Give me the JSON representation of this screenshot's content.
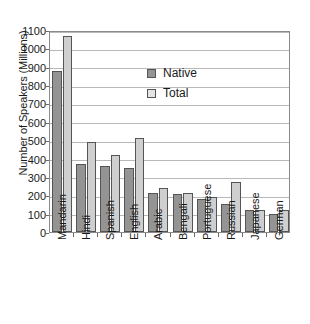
{
  "chart_data": {
    "type": "bar",
    "title": "",
    "xlabel": "",
    "ylabel": "Number of Speakers (Millions)",
    "ylim": [
      0,
      1100
    ],
    "ytick_step": 100,
    "yticks": [
      0,
      100,
      200,
      300,
      400,
      500,
      600,
      700,
      800,
      900,
      1000,
      1100
    ],
    "ytick_labels": [
      "0",
      "100",
      "200",
      "300",
      "400",
      "500",
      "600",
      "700",
      "800",
      "900",
      "1000",
      "1100"
    ],
    "grid": true,
    "legend_position": "upper-center",
    "categories": [
      "Mandarin",
      "Hindi",
      "Spanish",
      "English",
      "Arabic",
      "Bengali",
      "Portuguese",
      "Russian",
      "Japanese",
      "German"
    ],
    "series": [
      {
        "name": "Native",
        "color": "#949494",
        "values": [
          875,
          370,
          358,
          350,
          210,
          208,
          178,
          155,
          120,
          98
        ]
      },
      {
        "name": "Total",
        "color": "#cfcfcf",
        "values": [
          1065,
          490,
          420,
          512,
          240,
          215,
          193,
          270,
          120,
          120
        ]
      }
    ]
  },
  "legend": {
    "items": [
      {
        "label": "Native",
        "swatch": "native-swatch"
      },
      {
        "label": "Total",
        "swatch": "total-swatch"
      }
    ]
  }
}
